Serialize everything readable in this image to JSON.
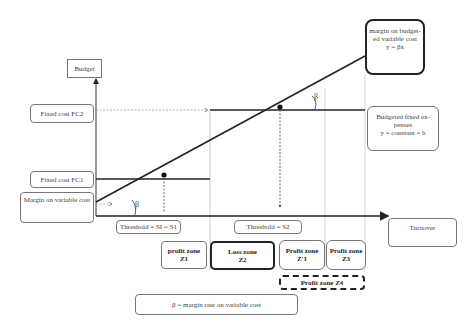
{
  "diagram": {
    "axes": {
      "y_label": "Budget",
      "x_label": "Turnover"
    },
    "left_labels": {
      "fc2": "Fixed cost FC2",
      "fc1": "Fixed cost FC1",
      "margin_variable": "Margin on variable cost"
    },
    "right_labels": {
      "margin_budgeted_line1": "margin on budget-",
      "margin_budgeted_line2": "ed variable cost",
      "margin_budgeted_line3": "y = βx",
      "fixed_expenses_line1": "Budgeted fixed ex-",
      "fixed_expenses_line2": "penses",
      "fixed_expenses_line3": "y = constant = b"
    },
    "thresholds": {
      "s1": "Threshold = SI = S1",
      "s2": "Threshold = S2"
    },
    "zones": [
      {
        "title": "profit zone",
        "id": "Z1"
      },
      {
        "title": "Loss zone",
        "id": "Z2"
      },
      {
        "title": "Profit zone",
        "id": "Z'1"
      },
      {
        "title": "Profit zone",
        "id": "Z3"
      }
    ],
    "zone_z4": "Profit zone Z4",
    "angle_symbol": "β",
    "legend": "β = margin rate on variable cost"
  }
}
